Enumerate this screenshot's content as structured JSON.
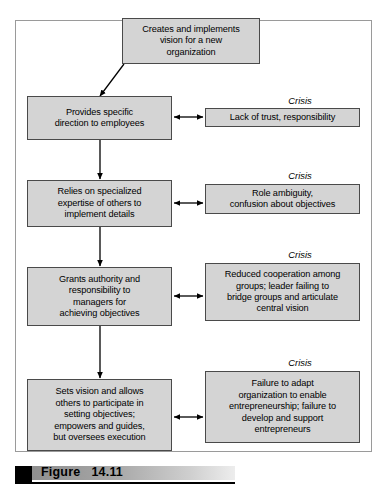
{
  "figure": {
    "caption_label": "Figure",
    "caption_number": "14.11",
    "caption_full": "Figure   14.11"
  },
  "crisis_label": "Crisis",
  "stages": [
    {
      "name": "creativity",
      "text": "Creates and implements\nvision for a new\norganization",
      "crisis": null
    },
    {
      "name": "direction",
      "text": "Provides specific\ndirection to employees",
      "crisis": "Lack of trust, responsibility"
    },
    {
      "name": "delegation",
      "text": "Relies on specialized\nexpertise of others to\nimplement details",
      "crisis": "Role ambiguity,\nconfusion about objectives"
    },
    {
      "name": "coordination",
      "text": "Grants authority and\nresponsibility to\nmanagers for\nachieving objectives",
      "crisis": "Reduced cooperation among\ngroups; leader failing to\nbridge groups and articulate\ncentral vision"
    },
    {
      "name": "collaboration",
      "text": "Sets vision and allows\nothers to participate in\nsetting objectives;\nempowers and guides,\nbut oversees execution",
      "crisis": "Failure to adapt\norganization to enable\nentrepreneurship; failure to\ndevelop and support\nentrepreneurs"
    }
  ],
  "colors": {
    "box_fill": "#d4d4d4",
    "box_border": "#4a4a4a",
    "frame_border": "#9a9a9a",
    "arrow": "#000000",
    "caption_bullet": "#000000"
  }
}
